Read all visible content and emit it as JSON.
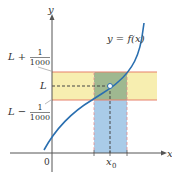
{
  "diagram": {
    "curve_label": "y = f(x)",
    "axes": {
      "x_label": "x",
      "y_label": "y",
      "origin_label": "0"
    },
    "y_marks": {
      "upper": {
        "prefix": "L + ",
        "num": "1",
        "den": "1000"
      },
      "center": "L",
      "lower": {
        "prefix": "L − ",
        "num": "1",
        "den": "1000"
      }
    },
    "x_marks": {
      "center": "x",
      "center_sub": "0"
    },
    "colors": {
      "curve": "#2a6fb0",
      "y_band": "#f7eeb0",
      "x_band": "#a9cbe8",
      "overlap": "#9fb890",
      "band_edge": "#e8806a",
      "axis": "#555555",
      "dash": "#555555"
    }
  }
}
